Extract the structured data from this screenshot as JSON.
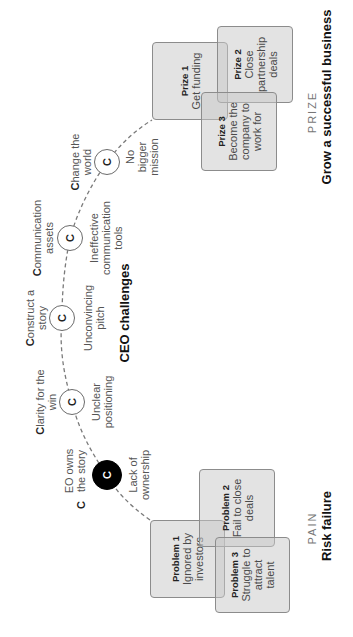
{
  "pain": {
    "label": "PAIN",
    "title": "Risk failure",
    "problems": [
      {
        "title": "Problem 1",
        "text": "Ignored by investors"
      },
      {
        "title": "Problem 2",
        "text": "Fail to close deals"
      },
      {
        "title": "Problem 3",
        "text": "Struggle to attract talent"
      }
    ]
  },
  "challenges": {
    "title": "CEO challenges",
    "nodes": [
      {
        "glyph": "C",
        "above_first": "C",
        "above_rest": "EO owns the story",
        "below": "Lack of ownership",
        "highlighted": true
      },
      {
        "glyph": "C",
        "above_first": "C",
        "above_rest": "larity for the win",
        "below": "Unclear positioning"
      },
      {
        "glyph": "C",
        "above_first": "C",
        "above_rest": "onstruct a story",
        "below": "Unconvincing pitch"
      },
      {
        "glyph": "C",
        "above_first": "C",
        "above_rest": "ommunication assets",
        "below": "Ineffective communication tools"
      },
      {
        "glyph": "C",
        "above_first": "C",
        "above_rest": "hange the world",
        "below": "No bigger mission"
      }
    ]
  },
  "prize": {
    "label": "PRIZE",
    "title": "Grow a successful business",
    "prizes": [
      {
        "title": "Prize 1",
        "text": "Get funding"
      },
      {
        "title": "Prize 2",
        "text": "Close partnership deals"
      },
      {
        "title": "Prize 3",
        "text": "Become the company to work for"
      }
    ]
  },
  "colors": {
    "box_fill": "#e2e2e2",
    "box_border": "#8c8c8c",
    "highlight_node": "#000000"
  }
}
